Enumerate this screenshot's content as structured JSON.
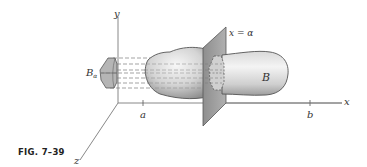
{
  "figure": {
    "caption": "FIG. 7–39",
    "labels": {
      "y_axis": "y",
      "x_axis": "x",
      "z_axis": "z",
      "tick_a": "a",
      "tick_b": "b",
      "plane": "x = α",
      "solid": "B",
      "cross_section_base": "B",
      "cross_section_sub": "α"
    },
    "colors": {
      "axis": "#7a7a7a",
      "outline": "#555555",
      "solid_fill_light": "#f2f2f2",
      "solid_fill_dark": "#a8a8a8",
      "plane_fill": "#9c9c9c",
      "cross_section_fill": "#b5b5b5",
      "dash": "#7d7d7d"
    }
  }
}
